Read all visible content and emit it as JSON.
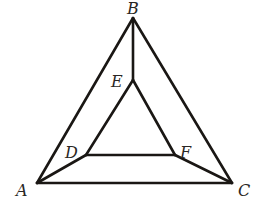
{
  "diagram": {
    "type": "geometry",
    "points": [
      {
        "id": "A",
        "label": "A",
        "x": 37,
        "y": 183,
        "label_x": 16,
        "label_y": 196
      },
      {
        "id": "B",
        "label": "B",
        "x": 133,
        "y": 18,
        "label_x": 127,
        "label_y": 14
      },
      {
        "id": "C",
        "label": "C",
        "x": 232,
        "y": 183,
        "label_x": 238,
        "label_y": 196
      },
      {
        "id": "D",
        "label": "D",
        "x": 86,
        "y": 155,
        "label_x": 65,
        "label_y": 158
      },
      {
        "id": "E",
        "label": "E",
        "x": 133,
        "y": 80,
        "label_x": 111,
        "label_y": 87
      },
      {
        "id": "F",
        "label": "F",
        "x": 175,
        "y": 155,
        "label_x": 180,
        "label_y": 158
      }
    ],
    "segments": [
      {
        "id": "AB",
        "from": "A",
        "to": "B"
      },
      {
        "id": "BC",
        "from": "B",
        "to": "C"
      },
      {
        "id": "CA",
        "from": "C",
        "to": "A"
      },
      {
        "id": "DE",
        "from": "D",
        "to": "E"
      },
      {
        "id": "EF",
        "from": "E",
        "to": "F"
      },
      {
        "id": "FD",
        "from": "F",
        "to": "D"
      },
      {
        "id": "AD",
        "from": "A",
        "to": "D"
      },
      {
        "id": "BE",
        "from": "B",
        "to": "E"
      },
      {
        "id": "CF",
        "from": "C",
        "to": "F"
      }
    ],
    "stroke_color": "#1a1714",
    "background_color": "#ffffff"
  }
}
